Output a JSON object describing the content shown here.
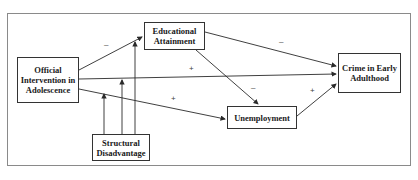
{
  "diagram": {
    "nodes": {
      "official_intervention": "Official Intervention in Adolescence",
      "educational_attainment": "Educational Attainment",
      "crime": "Crime in Early Adulthood",
      "unemployment": "Unemployment",
      "structural_disadvantage": "Structural Disadvantage"
    },
    "edges": [
      {
        "from": "Official Intervention in Adolescence",
        "to": "Educational Attainment",
        "sign": "–"
      },
      {
        "from": "Official Intervention in Adolescence",
        "to": "Crime in Early Adulthood",
        "sign": "+"
      },
      {
        "from": "Official Intervention in Adolescence",
        "to": "Unemployment",
        "sign": "+"
      },
      {
        "from": "Educational Attainment",
        "to": "Crime in Early Adulthood",
        "sign": "–"
      },
      {
        "from": "Educational Attainment",
        "to": "Unemployment",
        "sign": "–"
      },
      {
        "from": "Unemployment",
        "to": "Crime in Early Adulthood",
        "sign": "+"
      },
      {
        "from": "Structural Disadvantage",
        "to": "Official Intervention in Adolescence",
        "sign": ""
      },
      {
        "from": "Structural Disadvantage",
        "to": "Official Intervention → Crime path",
        "sign": ""
      },
      {
        "from": "Structural Disadvantage",
        "to": "Official Intervention → Educational Attainment path",
        "sign": ""
      }
    ],
    "signs": {
      "oi_ea": "–",
      "oi_crime": "+",
      "oi_unemp": "+",
      "ea_crime": "–",
      "ea_unemp": "–",
      "unemp_crime": "+"
    },
    "colors": {
      "line": "#2a2a2a",
      "frame": "#8a8a8a"
    }
  }
}
